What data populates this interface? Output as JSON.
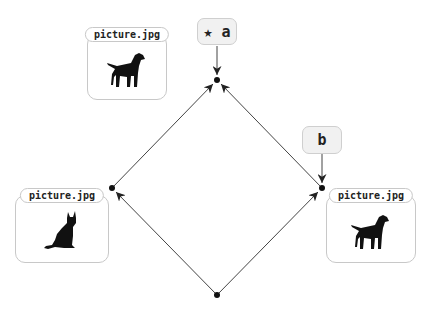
{
  "diagram": {
    "nodes": [
      {
        "id": "bottom",
        "x": 217,
        "y": 295
      },
      {
        "id": "left",
        "x": 112,
        "y": 188
      },
      {
        "id": "right",
        "x": 322,
        "y": 188
      },
      {
        "id": "top",
        "x": 217,
        "y": 80
      }
    ],
    "edges": [
      {
        "from": "bottom",
        "to": "left"
      },
      {
        "from": "bottom",
        "to": "right"
      },
      {
        "from": "left",
        "to": "top"
      },
      {
        "from": "right",
        "to": "top"
      }
    ],
    "cards": {
      "top_left": {
        "filename": "picture.jpg",
        "image": "dog-silhouette-icon"
      },
      "left": {
        "filename": "picture.jpg",
        "image": "cat-silhouette-icon"
      },
      "right": {
        "filename": "picture.jpg",
        "image": "dog-silhouette-icon"
      }
    },
    "labels": {
      "a": {
        "text": "★ a",
        "points_to": "top"
      },
      "b": {
        "text": "b",
        "points_to": "right"
      }
    },
    "colors": {
      "line": "#222222",
      "card_border": "#c8c8c8",
      "label_bg": "#f1f1f1"
    }
  }
}
